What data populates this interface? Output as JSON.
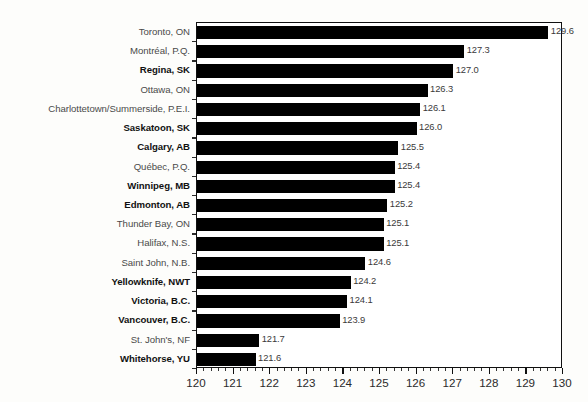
{
  "chart_data": {
    "type": "bar",
    "orientation": "horizontal",
    "title": "",
    "xlabel": "",
    "ylabel": "",
    "xlim": [
      120,
      130
    ],
    "grid": false,
    "legend": null,
    "xticks": [
      "120",
      "121",
      "122",
      "123",
      "124",
      "125",
      "126",
      "127",
      "128",
      "129",
      "130"
    ],
    "xtick_minor_step": 0.2,
    "bar_color": "#000000",
    "categories": [
      "Toronto, ON",
      "Montréal, P.Q.",
      "Regina, SK",
      "Ottawa, ON",
      "Charlottetown/Summerside, P.E.I.",
      "Saskatoon, SK",
      "Calgary, AB",
      "Québec, P.Q.",
      "Winnipeg, MB",
      "Edmonton, AB",
      "Thunder Bay, ON",
      "Halifax, N.S.",
      "Saint John, N.B.",
      "Yellowknife, NWT",
      "Victoria, B.C.",
      "Vancouver, B.C.",
      "St. John's, NF",
      "Whitehorse, YU"
    ],
    "values": [
      129.6,
      127.3,
      127.0,
      126.3,
      126.1,
      126.0,
      125.5,
      125.4,
      125.4,
      125.2,
      125.1,
      125.1,
      124.6,
      124.2,
      124.1,
      123.9,
      121.7,
      121.6
    ],
    "value_labels": [
      "129.6",
      "127.3",
      "127.0",
      "126.3",
      "126.1",
      "126.0",
      "125.5",
      "125.4",
      "125.4",
      "125.2",
      "125.1",
      "125.1",
      "124.6",
      "124.2",
      "124.1",
      "123.9",
      "121.7",
      "121.6"
    ],
    "emphasized": [
      false,
      false,
      true,
      false,
      false,
      true,
      true,
      false,
      true,
      true,
      false,
      false,
      false,
      true,
      true,
      true,
      false,
      true
    ]
  }
}
